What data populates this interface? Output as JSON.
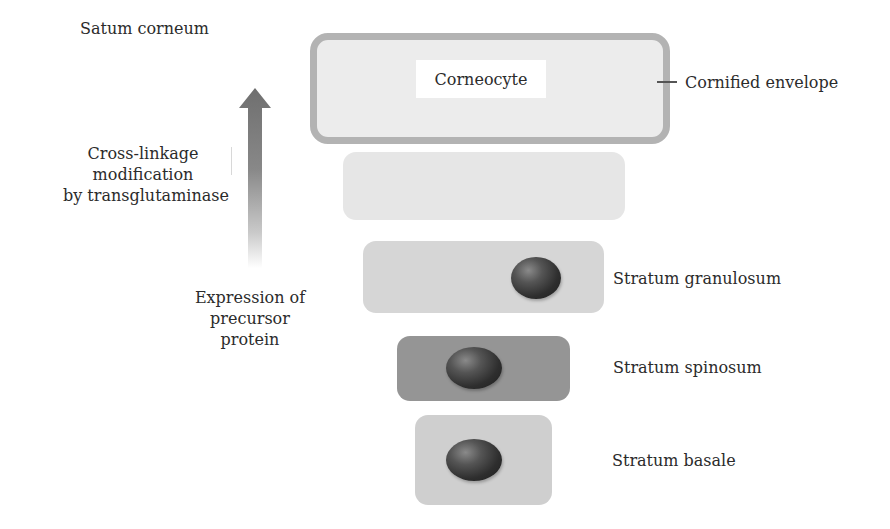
{
  "diagram": {
    "title_layer": "Satum corneum",
    "corneocyte": {
      "label": "Corneocyte",
      "callout": "Cornified envelope"
    },
    "process_arrow": {
      "direction": "up",
      "label_lines": [
        "Cross-linkage",
        "modification",
        "by transglutaminase"
      ]
    },
    "expression_label_lines": [
      "Expression of",
      "precursor",
      "protein"
    ],
    "layers": [
      {
        "name": "Stratum corneum (transitional cell)",
        "label": "",
        "fill": "#e6e6e6",
        "has_nucleus": false
      },
      {
        "name": "Stratum granulosum",
        "label": "Stratum granulosum",
        "fill": "#d6d6d6",
        "has_nucleus": true
      },
      {
        "name": "Stratum spinosum",
        "label": "Stratum spinosum",
        "fill": "#959595",
        "has_nucleus": true
      },
      {
        "name": "Stratum basale",
        "label": "Stratum basale",
        "fill": "#cfcfcf",
        "has_nucleus": true
      }
    ],
    "colors": {
      "envelope_border": "#b3b3b3",
      "corneocyte_fill": "#ececec",
      "arrow": "#7a7a7a",
      "nucleus": "#2e2e2e"
    }
  }
}
